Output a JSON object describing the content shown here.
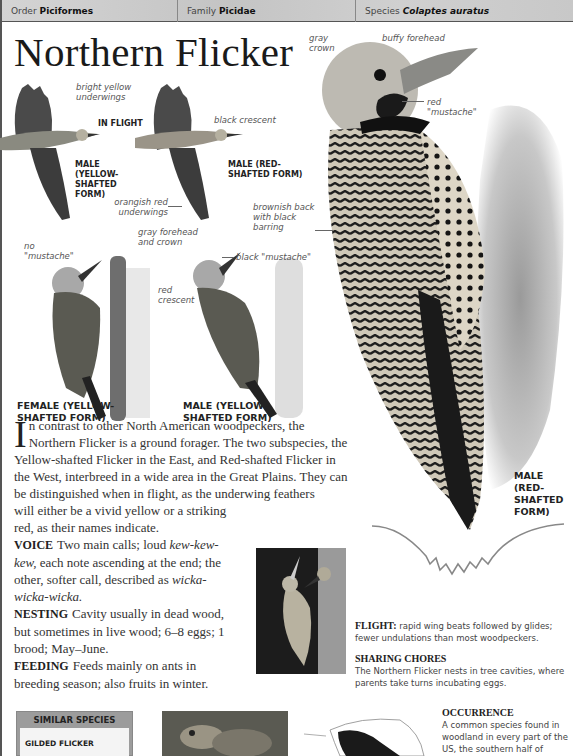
{
  "header": {
    "order_label": "Order",
    "order_value": "Piciformes",
    "family_label": "Family",
    "family_value": "Picidae",
    "species_label": "Species",
    "species_value": "Colaptes auratus"
  },
  "title": "Northern Flicker",
  "flight_section": {
    "heading": "IN FLIGHT",
    "labels": {
      "bright_yellow": "bright yellow underwings",
      "black_crescent": "black crescent",
      "orangish_red": "orangish red underwings"
    },
    "captions": {
      "male_yellow": "MALE (YELLOW- SHAFTED FORM)",
      "male_red": "MALE (RED- SHAFTED FORM)"
    }
  },
  "perched_section": {
    "labels": {
      "no_mustache": "no \"mustache\"",
      "gray_forehead": "gray forehead and crown",
      "red_crescent": "red crescent",
      "black_mustache": "black \"mustache\""
    },
    "captions": {
      "female_yellow": "FEMALE (YELLOW- SHAFTED FORM)",
      "male_yellow": "MALE (YELLOW- SHAFTED FORM)"
    }
  },
  "main_bird": {
    "labels": {
      "gray_crown": "gray crown",
      "buffy_forehead": "buffy forehead",
      "red_mustache": "red \"mustache\"",
      "brownish_back": "brownish back with black barring"
    },
    "caption": "MALE (RED- SHAFTED FORM)"
  },
  "description": {
    "dropcap": "I",
    "intro": "n contrast to other North American woodpeckers, the Northern Flicker is a ground forager. The two subspecies, the Yellow-shafted Flicker in the East, and Red-shafted Flicker in the West, interbreed in a wide area in the Great Plains. They can be distinguished when in flight, as the underwing feathers",
    "intro_cont": "will either be a vivid yellow or a striking red, as their names indicate.",
    "voice_label": "VOICE",
    "voice_1": "Two main calls; loud",
    "voice_call_1": "kew-kew-kew,",
    "voice_2": "each note ascending at the end; the other, softer call, described as",
    "voice_call_2": "wicka-wicka-wicka.",
    "nesting_label": "NESTING",
    "nesting": "Cavity usually in dead wood, but sometimes in live wood; 6–8 eggs; 1 brood; May–June.",
    "feeding_label": "FEEDING",
    "feeding": "Feeds mainly on ants in breeding season; also fruits in winter."
  },
  "flight": {
    "label": "FLIGHT:",
    "text": "rapid wing beats followed by glides; fewer undulations than most woodpeckers."
  },
  "sharing_chores": {
    "heading": "SHARING CHORES",
    "text": "The Northern Flicker nests in tree cavities, where parents take turns incubating eggs."
  },
  "occurrence": {
    "heading": "OCCURRENCE",
    "text": "A common species found in woodland in every part of the US, the southern half of"
  },
  "similar_species": {
    "heading": "SIMILAR SPECIES",
    "items": [
      "GILDED FLICKER"
    ]
  }
}
